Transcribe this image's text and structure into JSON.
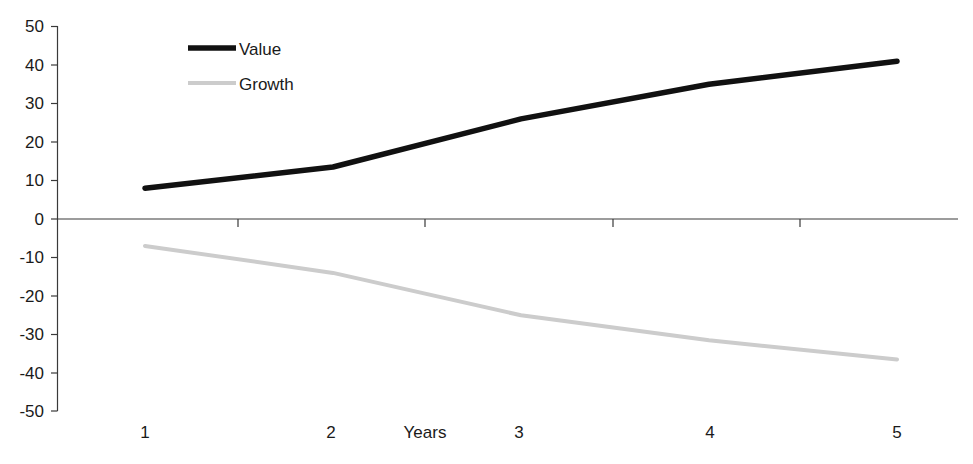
{
  "chart_data": {
    "type": "line",
    "title": "",
    "xlabel": "Years",
    "ylabel": "",
    "x": [
      1,
      2,
      3,
      4,
      5
    ],
    "categories": [
      "1",
      "2",
      "3",
      "4",
      "5"
    ],
    "xticklabels": [
      "1",
      "2",
      "3",
      "4",
      "5"
    ],
    "yticklabels": [
      "50",
      "40",
      "30",
      "20",
      "10",
      "0",
      "-10",
      "-20",
      "-30",
      "-40",
      "-50"
    ],
    "yticks": [
      50,
      40,
      30,
      20,
      10,
      0,
      -10,
      -20,
      -30,
      -40,
      -50
    ],
    "ylim": [
      -50,
      50
    ],
    "xlim": [
      1,
      5
    ],
    "grid": false,
    "legend_position": "top-center-left",
    "series": [
      {
        "name": "Value",
        "values": [
          8,
          13.5,
          26,
          35,
          41
        ],
        "color": "#111111",
        "width": 5.5
      },
      {
        "name": "Growth",
        "values": [
          -7,
          -14,
          -25,
          -31.5,
          -36.5
        ],
        "color": "#cccccc",
        "width": 4
      }
    ]
  },
  "legend": {
    "items": [
      {
        "label": "Value",
        "color": "#111111",
        "width": 5.5
      },
      {
        "label": "Growth",
        "color": "#cccccc",
        "width": 4
      }
    ]
  },
  "axes": {
    "x_axis_title": "Years",
    "zero_line_label": "0"
  }
}
